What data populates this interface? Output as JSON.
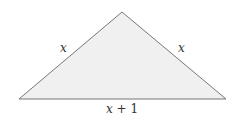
{
  "diagram": {
    "type": "isosceles-triangle",
    "colors": {
      "fill": "#f0f0f0",
      "stroke": "#777777",
      "text": "#333333"
    },
    "vertices": {
      "apex": [
        122,
        12
      ],
      "left": [
        19,
        99
      ],
      "right": [
        226,
        99
      ]
    },
    "labels": {
      "left_side": "x",
      "right_side": "x",
      "base_var": "x",
      "base_rest": " + 1"
    }
  }
}
